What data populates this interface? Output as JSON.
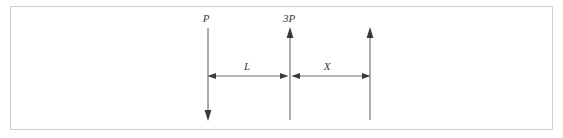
{
  "figure": {
    "background_color": "#ffffff",
    "frame_color": "#cfcfcf",
    "line_color": "#5a5a5a",
    "label_color": "#3a3a3a"
  },
  "forces": [
    {
      "id": "force-p",
      "label": "P",
      "direction": "down",
      "x": 208,
      "tail_y": 28,
      "head_y": 120,
      "label_x": 206,
      "label_y": 22
    },
    {
      "id": "force-3p",
      "label": "3P",
      "direction": "up",
      "x": 290,
      "tail_y": 120,
      "head_y": 28,
      "label_x": 283,
      "label_y": 22
    },
    {
      "id": "force-reaction",
      "label": "",
      "direction": "up",
      "x": 370,
      "tail_y": 120,
      "head_y": 28,
      "label_x": 368,
      "label_y": 22
    }
  ],
  "dimensions": [
    {
      "id": "dimension-l",
      "label": "L",
      "y": 76,
      "x_start": 208,
      "x_end": 289,
      "label_x": 247,
      "label_y": 70
    },
    {
      "id": "dimension-x",
      "label": "X",
      "y": 76,
      "x_start": 291,
      "x_end": 370,
      "label_x": 327,
      "label_y": 70
    }
  ],
  "extension_lines": [
    {
      "id": "ext-left",
      "x": 208
    },
    {
      "id": "ext-mid",
      "x": 290
    },
    {
      "id": "ext-right",
      "x": 370
    }
  ]
}
